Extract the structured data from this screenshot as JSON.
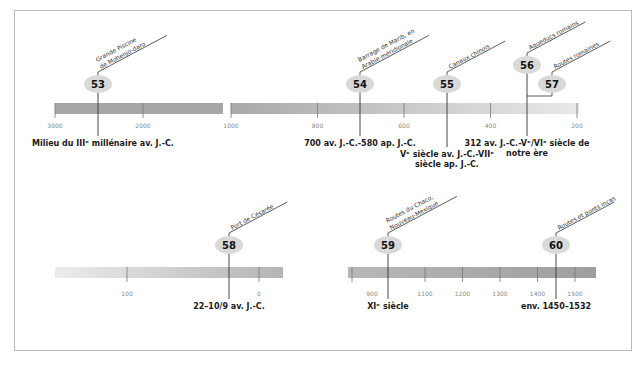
{
  "colors": {
    "bar_dark": "#a6a6a6",
    "bar_light": "#e8e8e8",
    "bubble": "#d9d9d9",
    "line": "#333333",
    "frame": "#bdbdbd"
  },
  "timelines": [
    {
      "id": "top-left",
      "ticks": [
        {
          "value": 3000,
          "label": "3000"
        },
        {
          "value": 2000,
          "label": "2000"
        }
      ],
      "events": [
        {
          "number": "53",
          "caption": [
            "Grande Piscine",
            "de Mohenjo-daro"
          ],
          "date": [
            "Milieu du IIIᵉ millénaire av. J.-C."
          ]
        }
      ]
    },
    {
      "id": "top-right",
      "ticks": [
        {
          "value": 1000,
          "label": "1000"
        },
        {
          "value": 800,
          "label": "800"
        },
        {
          "value": 600,
          "label": "600"
        },
        {
          "value": 400,
          "label": "400"
        },
        {
          "value": 200,
          "label": "200"
        }
      ],
      "events": [
        {
          "number": "54",
          "caption": [
            "Barrage de Marib, en",
            "Arabie méridionale"
          ],
          "date": [
            "700 av. J.-C.-580 ap. J.-C."
          ]
        },
        {
          "number": "55",
          "caption": [
            "Canaux chinois"
          ],
          "date": [
            "Vᵉ siècle av. J.-C.-VIIᵉ",
            "siècle ap. J.-C."
          ]
        },
        {
          "number": "56",
          "caption": [
            "Aqueducs romains"
          ],
          "date": [
            "312 av. J.-C.-Vᵉ/VIᵉ siècle de",
            "notre ère"
          ]
        },
        {
          "number": "57",
          "caption": [
            "Routes romaines"
          ],
          "date": []
        }
      ]
    },
    {
      "id": "bottom-left",
      "ticks": [
        {
          "value": 100,
          "label": "100"
        },
        {
          "value": 0,
          "label": "0"
        }
      ],
      "events": [
        {
          "number": "58",
          "caption": [
            "Port de Césarée"
          ],
          "date": [
            "22–10/9 av. J.-C."
          ]
        }
      ]
    },
    {
      "id": "bottom-right",
      "ticks": [
        {
          "value": 900,
          "label": "900"
        },
        {
          "value": 1100,
          "label": "1100"
        },
        {
          "value": 1200,
          "label": "1200"
        },
        {
          "value": 1300,
          "label": "1300"
        },
        {
          "value": 1400,
          "label": "1400"
        },
        {
          "value": 1500,
          "label": "1500"
        }
      ],
      "events": [
        {
          "number": "59",
          "caption": [
            "Routes du Chaco,",
            "Nouveau-Mexique"
          ],
          "date": [
            "XIᵉ siècle"
          ]
        },
        {
          "number": "60",
          "caption": [
            "Routes et ponts incas"
          ],
          "date": [
            "env. 1450–1532"
          ]
        }
      ]
    }
  ]
}
